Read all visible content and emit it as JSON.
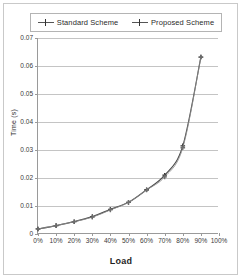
{
  "chart_data": {
    "type": "line",
    "title": "",
    "xlabel": "Load",
    "ylabel": "Time (s)",
    "x": [
      0,
      10,
      20,
      30,
      40,
      50,
      60,
      70,
      80,
      90
    ],
    "xtick_labels": [
      "0%",
      "10%",
      "20%",
      "30%",
      "40%",
      "50%",
      "60%",
      "70%",
      "80%",
      "90%",
      "100%"
    ],
    "xtick_values": [
      0,
      10,
      20,
      30,
      40,
      50,
      60,
      70,
      80,
      90,
      100
    ],
    "ytick_labels": [
      "0",
      "0.01",
      "0.02",
      "0.03",
      "0.04",
      "0.05",
      "0.06",
      "0.07"
    ],
    "ytick_values": [
      0,
      0.01,
      0.02,
      0.03,
      0.04,
      0.05,
      0.06,
      0.07
    ],
    "xlim": [
      0,
      100
    ],
    "ylim": [
      0,
      0.07
    ],
    "grid": "horizontal",
    "legend_position": "top",
    "series": [
      {
        "name": "Standard Scheme",
        "color": "#4a4a4a",
        "marker": "plus",
        "values": [
          0.0018,
          0.003,
          0.0044,
          0.0062,
          0.0088,
          0.0113,
          0.0158,
          0.021,
          0.0315,
          0.0632
        ]
      },
      {
        "name": "Proposed Scheme",
        "color": "#8c8c8c",
        "marker": "plus",
        "values": [
          0.0018,
          0.003,
          0.0044,
          0.006,
          0.0086,
          0.0113,
          0.0157,
          0.0204,
          0.0308,
          0.0632
        ]
      }
    ]
  },
  "legend": {
    "entries": [
      {
        "label": "Standard Scheme"
      },
      {
        "label": "Proposed Scheme"
      }
    ]
  },
  "axes": {
    "x_title": "Load",
    "y_title": "Time (s)"
  }
}
